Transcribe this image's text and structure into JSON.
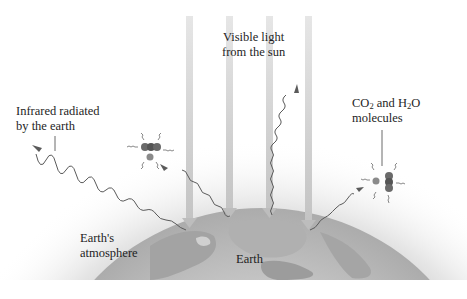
{
  "diagram": {
    "type": "greenhouse-effect",
    "labels": {
      "sunlight_line1": "Visible light",
      "sunlight_line2": "from the sun",
      "infrared_line1": "Infrared radiated",
      "infrared_line2": "by the earth",
      "molecules_co2": "CO",
      "molecules_sub1": "2",
      "molecules_and": " and H",
      "molecules_sub2": "2",
      "molecules_o": "O",
      "molecules_line2": "molecules",
      "atmosphere_line1": "Earth's",
      "atmosphere_line2": "atmosphere",
      "earth": "Earth"
    },
    "elements": {
      "sunlight_beams": 4,
      "infrared_waves": 4,
      "molecule_clusters": 2
    },
    "colors": {
      "beam": "#d4d4d4",
      "earth_ocean": "#bdbdbd",
      "earth_land": "#9a9a9a",
      "atmosphere": "#e2e2e2",
      "wave": "#5a5a5a",
      "text": "#1e1e1e"
    }
  }
}
